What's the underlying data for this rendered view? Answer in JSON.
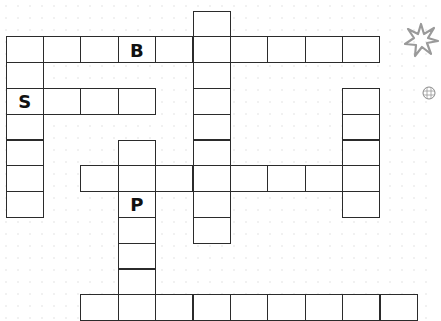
{
  "puzzle": {
    "type": "crossword",
    "grid": {
      "origin_x": 6,
      "origin_y": 11,
      "cell_w": 37.4,
      "cell_h": 25.8
    },
    "words": [
      {
        "id": "down-col5",
        "direction": "down",
        "row": 0,
        "col": 5,
        "length": 9
      },
      {
        "id": "across-row1",
        "direction": "across",
        "row": 1,
        "col": 0,
        "length": 10
      },
      {
        "id": "down-col0",
        "direction": "down",
        "row": 1,
        "col": 0,
        "length": 7
      },
      {
        "id": "across-row3",
        "direction": "across",
        "row": 3,
        "col": 0,
        "length": 4
      },
      {
        "id": "down-col9",
        "direction": "down",
        "row": 3,
        "col": 9,
        "length": 5
      },
      {
        "id": "down-col3",
        "direction": "down",
        "row": 5,
        "col": 3,
        "length": 6
      },
      {
        "id": "across-row6",
        "direction": "across",
        "row": 6,
        "col": 2,
        "length": 8
      },
      {
        "id": "across-row11",
        "direction": "across",
        "row": 11,
        "col": 2,
        "length": 9
      }
    ],
    "letters": [
      {
        "row": 1,
        "col": 3,
        "char": "B"
      },
      {
        "row": 3,
        "col": 0,
        "char": "S"
      },
      {
        "row": 7,
        "col": 3,
        "char": "P"
      }
    ]
  },
  "decorations": [
    {
      "name": "asterisk-flower-icon",
      "color": "#9a9a9a"
    },
    {
      "name": "ball-icon",
      "color": "#888888"
    }
  ],
  "colors": {
    "border": "#2b2b2b",
    "cell_bg": "#ffffff",
    "letter": "#111111"
  }
}
